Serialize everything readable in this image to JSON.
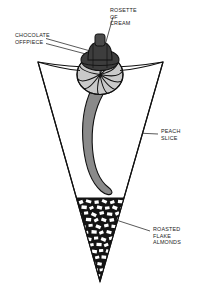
{
  "figure": {
    "background_color": "#ffffff",
    "line_color": "#111111",
    "callouts": [
      {
        "id": "chocolate-offpiece",
        "lines": [
          "CHOCOLATE",
          "OFFPIECE"
        ],
        "text_x": 15,
        "text_y": 37,
        "anchor": "start",
        "leaders": [
          {
            "x1": 46,
            "y1": 38.5,
            "x2": 101,
            "y2": 54
          },
          {
            "x1": 46,
            "y1": 43.5,
            "x2": 101,
            "y2": 58
          }
        ]
      },
      {
        "id": "rosette-of-cream",
        "lines": [
          "ROSETTE",
          "OF",
          "CREAM"
        ],
        "text_x": 110,
        "text_y": 12,
        "anchor": "start",
        "leaders": [
          {
            "x1": 113,
            "y1": 16,
            "x2": 100,
            "y2": 62
          }
        ]
      },
      {
        "id": "peach-slice",
        "lines": [
          "PEACH",
          "SLICE"
        ],
        "text_x": 160,
        "text_y": 134,
        "anchor": "start",
        "leaders": [
          {
            "x1": 158,
            "y1": 134,
            "x2": 94,
            "y2": 132
          }
        ]
      },
      {
        "id": "roasted-flake-almonds",
        "lines": [
          "ROASTED",
          "FLAKE",
          "ALMONDS"
        ],
        "text_x": 152,
        "text_y": 232,
        "anchor": "start",
        "leaders": [
          {
            "x1": 150,
            "y1": 231,
            "x2": 113,
            "y2": 220
          }
        ]
      }
    ],
    "components": {
      "cone": {
        "name": "cone",
        "fill": "#ffffff",
        "stroke": "#111111",
        "top_left_x": 38,
        "top_left_y": 62,
        "top_right_x": 163,
        "top_right_y": 62,
        "tip_x": 100,
        "tip_y": 281
      },
      "chocolate_offpiece": {
        "name": "chocolate-offpiece",
        "fill": "#3d3d3d",
        "stroke": "#111111"
      },
      "rosette_of_cream": {
        "name": "rosette-of-cream",
        "fill": "#c9c9c9",
        "stroke": "#111111",
        "swirl_count": 10
      },
      "peach_slice": {
        "name": "peach-slice",
        "fill": "#8a8a8a",
        "stroke": "#111111"
      },
      "roasted_flake_almonds": {
        "name": "roasted-flake-almonds",
        "fill": "#141414",
        "flake_fill": "#ffffff",
        "top_y": 198,
        "bottom_y": 279
      }
    }
  }
}
